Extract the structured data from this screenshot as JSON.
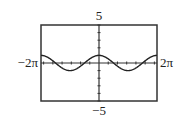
{
  "chart_data": {
    "type": "line",
    "title": "",
    "function": "y = cos(x)",
    "xlabel": "",
    "ylabel": "",
    "xlim": [
      -6.2832,
      6.2832
    ],
    "ylim": [
      -5,
      5
    ],
    "xscl": 1,
    "yscl": 1,
    "tick_labels": {
      "xmin": "−2π",
      "xmax": "2π",
      "ymax": "5",
      "ymin": "−5"
    },
    "grid": false,
    "legend": null,
    "series": [
      {
        "name": "cos(x)",
        "x": [
          -6.2832,
          -4.7124,
          -3.1416,
          -1.5708,
          0,
          1.5708,
          3.1416,
          4.7124,
          6.2832
        ],
        "values": [
          1,
          0,
          -1,
          0,
          1,
          0,
          -1,
          0,
          1
        ]
      }
    ]
  },
  "colors": {
    "curve": "#222222",
    "frame": "#333333",
    "axes": "#333333"
  }
}
